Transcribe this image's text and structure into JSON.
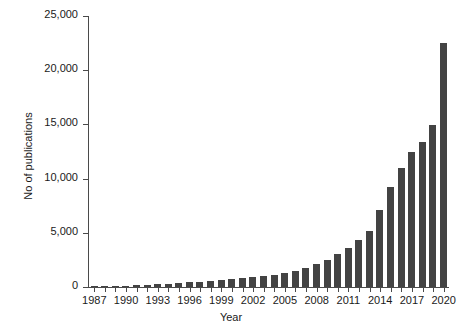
{
  "chart_data": {
    "type": "bar",
    "title": "",
    "xlabel": "Year",
    "ylabel": "No of publications",
    "categories": [
      1987,
      1988,
      1989,
      1990,
      1991,
      1992,
      1993,
      1994,
      1995,
      1996,
      1997,
      1998,
      1999,
      2000,
      2001,
      2002,
      2003,
      2004,
      2005,
      2006,
      2007,
      2008,
      2009,
      2010,
      2011,
      2012,
      2013,
      2014,
      2015,
      2016,
      2017,
      2018,
      2019,
      2020
    ],
    "values": [
      30,
      60,
      90,
      120,
      160,
      200,
      240,
      300,
      360,
      420,
      480,
      560,
      640,
      720,
      800,
      900,
      1000,
      1150,
      1300,
      1500,
      1800,
      2100,
      2500,
      3000,
      3600,
      4300,
      5200,
      7100,
      9200,
      11000,
      12500,
      13400,
      14900,
      22500
    ],
    "series": [
      {
        "name": "No of publications",
        "values": [
          30,
          60,
          90,
          120,
          160,
          200,
          240,
          300,
          360,
          420,
          480,
          560,
          640,
          720,
          800,
          900,
          1000,
          1150,
          1300,
          1500,
          1800,
          2100,
          2500,
          3000,
          3600,
          4300,
          5200,
          7100,
          9200,
          11000,
          12500,
          13400,
          14900,
          22500
        ]
      }
    ],
    "xtick_labels": [
      "1987",
      "1990",
      "1993",
      "1996",
      "1999",
      "2002",
      "2005",
      "2008",
      "2011",
      "2014",
      "2017",
      "2020"
    ],
    "ytick_labels": [
      "0",
      "5,000",
      "10,000",
      "15,000",
      "20,000",
      "25,000"
    ],
    "ytick_values": [
      0,
      5000,
      10000,
      15000,
      20000,
      25000
    ],
    "ylim": [
      0,
      25000
    ],
    "xlim": [
      1986.5,
      2020.5
    ],
    "grid": false,
    "legend": false,
    "bar_color": "#434343",
    "axis_color": "#4a4a4a",
    "text_color": "#1a1a1a",
    "background": "#ffffff"
  }
}
